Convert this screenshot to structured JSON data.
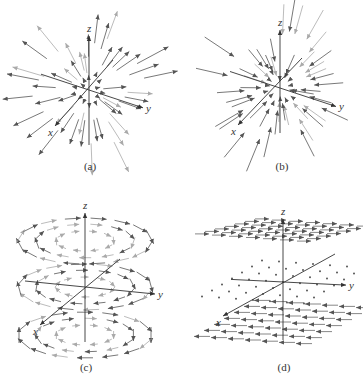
{
  "figure": {
    "panels": [
      {
        "id": "a",
        "caption": "(a)",
        "description": "Radial vector field pointing outward from origin",
        "field": "outward",
        "axes": {
          "x_label": "x",
          "y_label": "y",
          "z_label": "z"
        },
        "origin": [
          89,
          90
        ],
        "caption_pos": [
          70,
          168
        ]
      },
      {
        "id": "b",
        "caption": "(b)",
        "description": "Radial vector field pointing inward toward origin",
        "field": "inward",
        "axes": {
          "x_label": "x",
          "y_label": "y",
          "z_label": "z"
        },
        "origin": [
          280,
          88
        ],
        "caption_pos": [
          262,
          168
        ]
      },
      {
        "id": "c",
        "caption": "(c)",
        "description": "Rotational vector field circulating around z-axis",
        "field": "rotational",
        "axes": {
          "x_label": "x",
          "y_label": "y",
          "z_label": "z"
        },
        "origin": [
          85,
          287
        ],
        "caption_pos": [
          66,
          369
        ]
      },
      {
        "id": "d",
        "caption": "(d)",
        "description": "Constant-direction field varying in magnitude with height z",
        "field": "layered",
        "axes": {
          "x_label": "x",
          "y_label": "y",
          "z_label": "z"
        },
        "origin": [
          283,
          282
        ],
        "caption_pos": [
          264,
          369
        ]
      }
    ],
    "colors": {
      "axis": "#333333",
      "arrow_dark": "#555555",
      "arrow_light": "#aaaaaa"
    }
  }
}
